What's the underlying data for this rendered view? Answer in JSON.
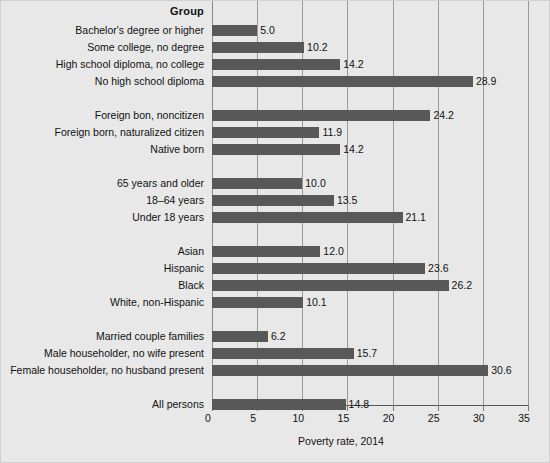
{
  "chart_data": {
    "type": "bar",
    "orientation": "horizontal",
    "title": "",
    "header_label": "Group",
    "xlabel": "Poverty rate, 2014",
    "ylabel": "",
    "xlim": [
      0,
      35
    ],
    "xticks": [
      0,
      5,
      10,
      15,
      20,
      25,
      30,
      35
    ],
    "xtick_labels": [
      "0",
      "5",
      "10",
      "15",
      "20",
      "25",
      "30",
      "35"
    ],
    "grid": true,
    "legend": "none",
    "bar_color": "#585858",
    "background_color": "#e8e8e8",
    "gridline_color": "#9a9a9a",
    "value_label_format": "one-decimal",
    "groups": [
      {
        "name": "Educational attainment",
        "categories": [
          "Bachelor's degree or higher",
          "Some college, no degree",
          "High school diploma, no college",
          "No high school diploma"
        ],
        "values": [
          5.0,
          10.2,
          14.2,
          28.9
        ],
        "value_labels": [
          "5.0",
          "10.2",
          "14.2",
          "28.9"
        ]
      },
      {
        "name": "Nativity",
        "categories": [
          "Foreign bon, noncitizen",
          "Foreign born, naturalized citizen",
          "Native born"
        ],
        "values": [
          24.2,
          11.9,
          14.2
        ],
        "value_labels": [
          "24.2",
          "11.9",
          "14.2"
        ]
      },
      {
        "name": "Age",
        "categories": [
          "65 years and older",
          "18–64 years",
          "Under 18 years"
        ],
        "values": [
          10.0,
          13.5,
          21.1
        ],
        "value_labels": [
          "10.0",
          "13.5",
          "21.1"
        ]
      },
      {
        "name": "Race and ethnicity",
        "categories": [
          "Asian",
          "Hispanic",
          "Black",
          "White, non-Hispanic"
        ],
        "values": [
          12.0,
          23.6,
          26.2,
          10.1
        ],
        "value_labels": [
          "12.0",
          "23.6",
          "26.2",
          "10.1"
        ]
      },
      {
        "name": "Family type",
        "categories": [
          "Married couple families",
          "Male householder, no wife present",
          "Female householder, no husband present"
        ],
        "values": [
          6.2,
          15.7,
          30.6
        ],
        "value_labels": [
          "6.2",
          "15.7",
          "30.6"
        ]
      },
      {
        "name": "Total",
        "categories": [
          "All persons"
        ],
        "values": [
          14.8
        ],
        "value_labels": [
          "14.8"
        ]
      }
    ]
  }
}
